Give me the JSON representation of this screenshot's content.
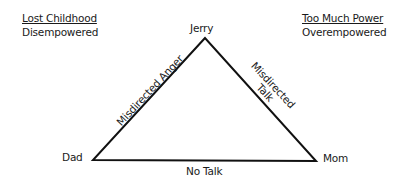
{
  "diagram": {
    "type": "family-triangle",
    "nodes": {
      "top": {
        "label": "Jerry"
      },
      "left": {
        "label": "Dad"
      },
      "right": {
        "label": "Mom"
      }
    },
    "edges": {
      "left": {
        "from": "Dad",
        "to": "Jerry",
        "label": "Misdirected Anger"
      },
      "right": {
        "from": "Jerry",
        "to": "Mom",
        "label_line1": "Misdirected",
        "label_line2": "Talk"
      },
      "bottom": {
        "from": "Dad",
        "to": "Mom",
        "label": "No Talk"
      }
    },
    "annotations": {
      "left": {
        "heading": "Lost Childhood",
        "subheading": "Disempowered"
      },
      "right": {
        "heading": "Too Much Power",
        "subheading": "Overempowered"
      }
    },
    "colors": {
      "line": "#111111",
      "text": "#1a1a1a",
      "background": "#ffffff"
    }
  }
}
